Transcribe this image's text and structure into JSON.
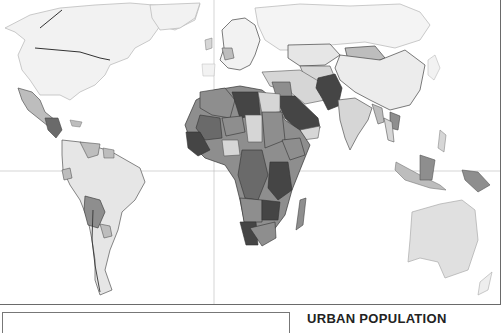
{
  "map": {
    "title": "URBAN POPULATION",
    "projection_lines": {
      "equator_y": 171,
      "prime_meridian_x": 214
    },
    "colors": {
      "ocean": "#ffffff",
      "lightest": "#eeeeee",
      "light": "#d6d6d6",
      "medium_light": "#bdbdbd",
      "medium": "#8e8e8e",
      "dark": "#6a6a6a",
      "darkest": "#454545",
      "border": "#555555"
    }
  },
  "legend": {
    "title": "URBAN POPULATION"
  }
}
